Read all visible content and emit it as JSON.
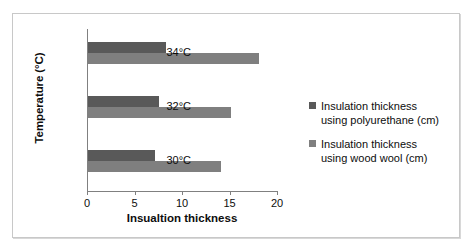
{
  "chart": {
    "ylabel": "Temperature (°C)",
    "xlabel": "Insualtion thickness"
  },
  "chart_data": {
    "type": "bar",
    "orientation": "horizontal",
    "title": "",
    "xlabel": "Insualtion thickness",
    "ylabel": "Temperature (°C)",
    "categories": [
      "30°C",
      "32°C",
      "34°C"
    ],
    "xlim": [
      0,
      20
    ],
    "xticks": [
      0,
      5,
      10,
      15,
      20
    ],
    "xticklabels": [
      "0",
      "5",
      "10",
      "15",
      "20"
    ],
    "grid": false,
    "legend_position": "right",
    "series": [
      {
        "name": "Insulation thickness using polyurethane (cm)",
        "name_line1": "Insulation thickness",
        "name_line2": "using polyurethane (cm)",
        "color": "#595959",
        "values": [
          7,
          7.5,
          8.2
        ]
      },
      {
        "name": "Insulation thickness using wood wool (cm)",
        "name_line1": "Insulation thickness",
        "name_line2": "using wood wool (cm)",
        "color": "#7f7f7f",
        "values": [
          14,
          15,
          18
        ]
      }
    ]
  }
}
